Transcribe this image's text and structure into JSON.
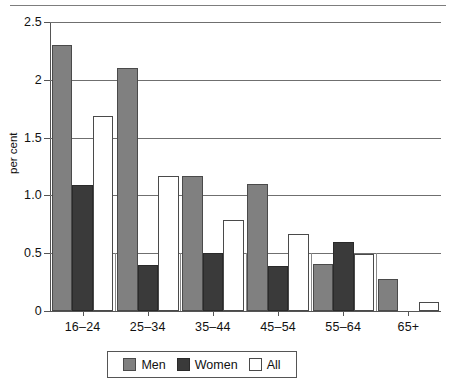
{
  "chart_data": {
    "type": "bar",
    "title": "",
    "subtitle": "",
    "xlabel": "",
    "ylabel": "per cent",
    "ylim": [
      0,
      2.5
    ],
    "grid": true,
    "grid_axis": "y",
    "legend_position": "bottom",
    "categories": [
      "16–24",
      "25–34",
      "35–44",
      "45–54",
      "55–64",
      "65+"
    ],
    "ytick_labels": [
      "0",
      "0.5",
      "1.0",
      "1.5",
      "2",
      "2.5"
    ],
    "ytick_values": [
      0,
      0.5,
      1.0,
      1.5,
      2.0,
      2.5
    ],
    "series": [
      {
        "name": "Men",
        "color": "#808080",
        "values": [
          2.3,
          2.1,
          1.17,
          1.1,
          0.41,
          0.28
        ]
      },
      {
        "name": "Women",
        "color": "#3a3a3a",
        "values": [
          1.09,
          0.4,
          0.5,
          0.39,
          0.6,
          0
        ]
      },
      {
        "name": "All",
        "color": "#ffffff",
        "values": [
          1.69,
          1.17,
          0.79,
          0.67,
          0.49,
          0.08
        ]
      }
    ]
  },
  "legend": {
    "entries": [
      {
        "label": "Men"
      },
      {
        "label": "Women"
      },
      {
        "label": "All"
      }
    ]
  },
  "colors": {
    "men": "#808080",
    "women": "#3a3a3a",
    "all": "#ffffff",
    "axis": "#555555",
    "gridline": "#6f6f6f",
    "rule": "#7d7d7d"
  }
}
